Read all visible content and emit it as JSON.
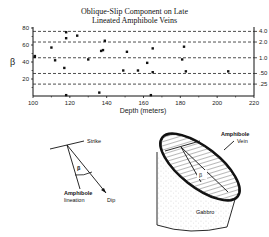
{
  "chart_data": {
    "type": "scatter",
    "title_lines": [
      "Oblique-Slip Component on Late",
      "Lineated Amphibole Veins"
    ],
    "xlabel": "Depth  (meters)",
    "ylabel": "β",
    "xlim": [
      100,
      220
    ],
    "ylim": [
      0,
      80
    ],
    "x_ticks": [
      100,
      120,
      140,
      160,
      180,
      200,
      220
    ],
    "y_ticks": [
      20,
      40,
      60,
      80
    ],
    "y_tick_labels": [
      "20",
      "40",
      "60",
      "80"
    ],
    "right_axis_labels": [
      "4.0",
      "2.0",
      "1.0",
      ".50",
      ".25"
    ],
    "reference_lines": [
      {
        "label": "4.0",
        "y": 76
      },
      {
        "label": "2.0",
        "y": 63.5
      },
      {
        "label": "1.0",
        "y": 45
      },
      {
        "label": ".50",
        "y": 26.5
      },
      {
        "label": ".25",
        "y": 14
      }
    ],
    "grid": false,
    "points": [
      {
        "x": 101,
        "y": 47
      },
      {
        "x": 101,
        "y": 46
      },
      {
        "x": 110,
        "y": 57
      },
      {
        "x": 112,
        "y": 42
      },
      {
        "x": 117,
        "y": 33
      },
      {
        "x": 118,
        "y": 75
      },
      {
        "x": 118,
        "y": 68
      },
      {
        "x": 118,
        "y": 1
      },
      {
        "x": 124,
        "y": 71
      },
      {
        "x": 130,
        "y": 43
      },
      {
        "x": 136,
        "y": 4
      },
      {
        "x": 137,
        "y": 53
      },
      {
        "x": 138,
        "y": 54
      },
      {
        "x": 139,
        "y": 65
      },
      {
        "x": 149,
        "y": 30
      },
      {
        "x": 151,
        "y": 52
      },
      {
        "x": 157,
        "y": 30
      },
      {
        "x": 162,
        "y": 39
      },
      {
        "x": 164,
        "y": 1
      },
      {
        "x": 165,
        "y": 56
      },
      {
        "x": 165,
        "y": 28
      },
      {
        "x": 181,
        "y": 43
      },
      {
        "x": 182,
        "y": 58
      },
      {
        "x": 183,
        "y": 29
      },
      {
        "x": 206,
        "y": 29
      }
    ]
  },
  "diagram_left": {
    "labels": {
      "strike": "Strike",
      "beta": "β",
      "lineation_1": "Amphibole",
      "lineation_2": "lineation",
      "dip": "Dip"
    }
  },
  "diagram_right": {
    "labels": {
      "vein_1": "Amphibole",
      "vein_2": "Vein",
      "beta": "β",
      "rock": "Gabbro"
    }
  }
}
